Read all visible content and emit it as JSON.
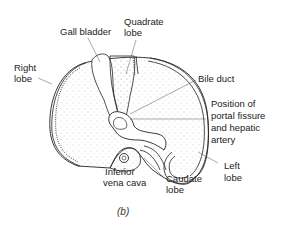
{
  "diagram": {
    "caption": "(b)",
    "labels": {
      "gall_bladder": "Gall bladder",
      "quadrate_lobe_1": "Quadrate",
      "quadrate_lobe_2": "lobe",
      "right_lobe_1": "Right",
      "right_lobe_2": "lobe",
      "bile_duct": "Bile duct",
      "portal_1": "Position of",
      "portal_2": "portal fissure",
      "portal_3": "and hepatic",
      "portal_4": "artery",
      "left_lobe_1": "Left",
      "left_lobe_2": "lobe",
      "caudate_1": "Caudate",
      "caudate_2": "lobe",
      "ivc_1": "Inferior",
      "ivc_2": "vena cava"
    },
    "colors": {
      "line": "#222222",
      "stipple": "#9a9a9a",
      "background": "#ffffff"
    }
  }
}
